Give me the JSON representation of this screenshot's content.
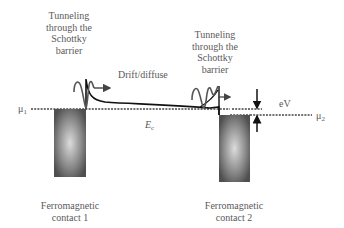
{
  "diagram": {
    "type": "band-diagram",
    "labels": {
      "tunnel_left": [
        "Tunneling",
        "through the",
        "Schottky",
        "barrier"
      ],
      "tunnel_right": [
        "Tunneling",
        "through the",
        "Schottky",
        "barrier"
      ],
      "drift": "Drift/diffuse",
      "mu1": "μ",
      "mu1_sub": "1",
      "mu2": "μ",
      "mu2_sub": "2",
      "ec": "E",
      "ec_sub": "c",
      "ev": "eV",
      "contact1": [
        "Ferromagnetic",
        "contact 1"
      ],
      "contact2": [
        "Ferromagnetic",
        "contact 2"
      ]
    },
    "colors": {
      "line": "#111111",
      "dotted": "#444444",
      "wave": "#555555",
      "contact_edge": "#4a4a4a",
      "contact_center": "#d8d8d8",
      "text": "#5a5a5a"
    }
  }
}
